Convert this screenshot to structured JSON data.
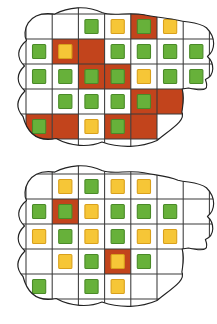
{
  "figure": {
    "panel_count": 2,
    "palette": {
      "cell_plain": "#ffffff",
      "cell_highlight": "#c2441c",
      "marker_green_fill": "#67b13a",
      "marker_green_stroke": "#4a8a28",
      "marker_yellow_fill": "#f6c637",
      "marker_yellow_stroke": "#d9a01c",
      "grid_line": "#3a3a3a",
      "blob_outline": "#222222",
      "background": "#ffffff"
    },
    "legend_note": "Orange cells mark highlighted grid squares; green and yellow squares mark two marker categories."
  },
  "panels": [
    {
      "id": "panel-top",
      "name": "top-blob-grid",
      "grid": {
        "cols": 7,
        "rows": 5
      },
      "cells": [
        [
          {
            "bg": "plain",
            "marker": "none"
          },
          {
            "bg": "plain",
            "marker": "none"
          },
          {
            "bg": "plain",
            "marker": "green"
          },
          {
            "bg": "plain",
            "marker": "yellow"
          },
          {
            "bg": "highlight",
            "marker": "green"
          },
          {
            "bg": "plain",
            "marker": "yellow"
          },
          {
            "bg": "plain",
            "marker": "none"
          }
        ],
        [
          {
            "bg": "plain",
            "marker": "green"
          },
          {
            "bg": "highlight",
            "marker": "yellow"
          },
          {
            "bg": "highlight",
            "marker": "none"
          },
          {
            "bg": "plain",
            "marker": "green"
          },
          {
            "bg": "plain",
            "marker": "green"
          },
          {
            "bg": "plain",
            "marker": "green"
          },
          {
            "bg": "plain",
            "marker": "green"
          }
        ],
        [
          {
            "bg": "plain",
            "marker": "green"
          },
          {
            "bg": "plain",
            "marker": "green"
          },
          {
            "bg": "highlight",
            "marker": "green"
          },
          {
            "bg": "highlight",
            "marker": "green"
          },
          {
            "bg": "plain",
            "marker": "yellow"
          },
          {
            "bg": "plain",
            "marker": "green"
          },
          {
            "bg": "plain",
            "marker": "green"
          }
        ],
        [
          {
            "bg": "plain",
            "marker": "none"
          },
          {
            "bg": "plain",
            "marker": "green"
          },
          {
            "bg": "plain",
            "marker": "green"
          },
          {
            "bg": "plain",
            "marker": "green"
          },
          {
            "bg": "highlight",
            "marker": "green"
          },
          {
            "bg": "highlight",
            "marker": "none"
          },
          {
            "bg": "plain",
            "marker": "none"
          }
        ],
        [
          {
            "bg": "highlight",
            "marker": "green"
          },
          {
            "bg": "highlight",
            "marker": "none"
          },
          {
            "bg": "plain",
            "marker": "yellow"
          },
          {
            "bg": "highlight",
            "marker": "green"
          },
          {
            "bg": "highlight",
            "marker": "none"
          },
          {
            "bg": "plain",
            "marker": "none"
          },
          {
            "bg": "plain",
            "marker": "none"
          }
        ]
      ],
      "counts": {
        "green": 21,
        "yellow": 5,
        "highlight_cells": 11
      }
    },
    {
      "id": "panel-bottom",
      "name": "bottom-blob-grid",
      "grid": {
        "cols": 7,
        "rows": 5
      },
      "cells": [
        [
          {
            "bg": "plain",
            "marker": "none"
          },
          {
            "bg": "plain",
            "marker": "yellow"
          },
          {
            "bg": "plain",
            "marker": "green"
          },
          {
            "bg": "plain",
            "marker": "yellow"
          },
          {
            "bg": "plain",
            "marker": "yellow"
          },
          {
            "bg": "plain",
            "marker": "none"
          },
          {
            "bg": "plain",
            "marker": "none"
          }
        ],
        [
          {
            "bg": "plain",
            "marker": "green"
          },
          {
            "bg": "highlight",
            "marker": "green"
          },
          {
            "bg": "plain",
            "marker": "yellow"
          },
          {
            "bg": "plain",
            "marker": "green"
          },
          {
            "bg": "plain",
            "marker": "green"
          },
          {
            "bg": "plain",
            "marker": "green"
          },
          {
            "bg": "plain",
            "marker": "none"
          }
        ],
        [
          {
            "bg": "plain",
            "marker": "yellow"
          },
          {
            "bg": "plain",
            "marker": "green"
          },
          {
            "bg": "plain",
            "marker": "yellow"
          },
          {
            "bg": "plain",
            "marker": "green"
          },
          {
            "bg": "plain",
            "marker": "yellow"
          },
          {
            "bg": "plain",
            "marker": "yellow"
          },
          {
            "bg": "plain",
            "marker": "none"
          }
        ],
        [
          {
            "bg": "plain",
            "marker": "none"
          },
          {
            "bg": "plain",
            "marker": "yellow"
          },
          {
            "bg": "plain",
            "marker": "green"
          },
          {
            "bg": "highlight",
            "marker": "yellow"
          },
          {
            "bg": "plain",
            "marker": "green"
          },
          {
            "bg": "plain",
            "marker": "none"
          },
          {
            "bg": "plain",
            "marker": "none"
          }
        ],
        [
          {
            "bg": "plain",
            "marker": "green"
          },
          {
            "bg": "plain",
            "marker": "none"
          },
          {
            "bg": "plain",
            "marker": "green"
          },
          {
            "bg": "plain",
            "marker": "yellow"
          },
          {
            "bg": "plain",
            "marker": "none"
          },
          {
            "bg": "plain",
            "marker": "none"
          },
          {
            "bg": "plain",
            "marker": "none"
          }
        ]
      ],
      "counts": {
        "green": 13,
        "yellow": 12,
        "highlight_cells": 2
      }
    }
  ]
}
